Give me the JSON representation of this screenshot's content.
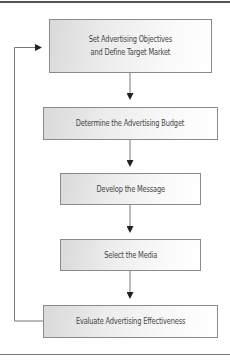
{
  "diagram": {
    "type": "flowchart",
    "steps": [
      {
        "label_line1": "Set Advertising Objectives",
        "label_line2": "and Define Target Market"
      },
      {
        "label": "Determine the Advertising Budget"
      },
      {
        "label": "Develop the Message"
      },
      {
        "label": "Select the Media"
      },
      {
        "label": "Evaluate Advertising Effectiveness"
      }
    ],
    "edges": [
      {
        "from": "Set Advertising Objectives and Define Target Market",
        "to": "Determine the Advertising Budget"
      },
      {
        "from": "Determine the Advertising Budget",
        "to": "Develop the Message"
      },
      {
        "from": "Develop the Message",
        "to": "Select the Media"
      },
      {
        "from": "Select the Media",
        "to": "Evaluate Advertising Effectiveness"
      },
      {
        "from": "Evaluate Advertising Effectiveness",
        "to": "Set Advertising Objectives and Define Target Market",
        "kind": "feedback-loop"
      }
    ],
    "colors": {
      "box_border": "#8a8a8a",
      "box_fill_start": "#d9d9d9",
      "box_fill_end": "#ffffff",
      "text": "#444444",
      "connector": "#333333"
    }
  }
}
